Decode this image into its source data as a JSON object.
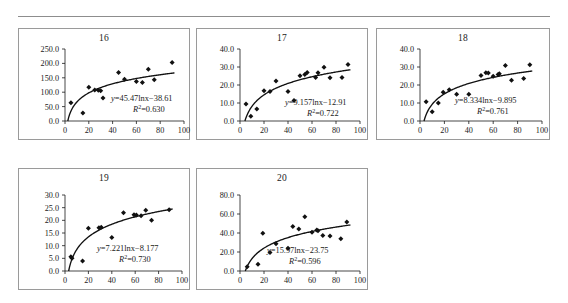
{
  "figure": {
    "has_top_rule": true,
    "panel_count": 5,
    "marker_shape": "diamond",
    "marker_color": "#111111",
    "curve_color": "#111111",
    "border_color": "#9a9a9a"
  },
  "chart_data": [
    {
      "type": "scatter",
      "title": "16",
      "xlabel": "",
      "ylabel": "",
      "xlim": [
        0,
        100
      ],
      "ylim": [
        0,
        250
      ],
      "xticks": [
        0,
        20,
        40,
        60,
        80,
        100
      ],
      "yticks": [
        "0.0",
        "50.0",
        "100.0",
        "150.0",
        "200.0",
        "250.0"
      ],
      "ytick_values": [
        0,
        50,
        100,
        150,
        200,
        250
      ],
      "grid": false,
      "legend": "none",
      "equation": "y=45.47lnx−38.61",
      "r2": "R²=0.630",
      "fit_a": 45.47,
      "fit_b": -38.61,
      "points": [
        [
          5,
          63
        ],
        [
          15,
          28
        ],
        [
          20,
          117
        ],
        [
          25,
          108
        ],
        [
          28,
          107
        ],
        [
          30,
          105
        ],
        [
          45,
          168
        ],
        [
          50,
          145
        ],
        [
          60,
          137
        ],
        [
          65,
          134
        ],
        [
          70,
          180
        ],
        [
          75,
          143
        ],
        [
          90,
          203
        ]
      ]
    },
    {
      "type": "scatter",
      "title": "17",
      "xlabel": "",
      "ylabel": "",
      "xlim": [
        0,
        100
      ],
      "ylim": [
        0,
        40
      ],
      "xticks": [
        0,
        20,
        40,
        60,
        80,
        100
      ],
      "yticks": [
        "0.0",
        "10.0",
        "20.0",
        "30.0",
        "40.0"
      ],
      "ytick_values": [
        0,
        10,
        20,
        30,
        40
      ],
      "grid": false,
      "legend": "none",
      "equation": "y=9.157lnx−12.91",
      "r2": "R²=0.722",
      "fit_a": 9.157,
      "fit_b": -12.91,
      "points": [
        [
          5,
          9.4
        ],
        [
          9,
          2.6
        ],
        [
          14,
          6.7
        ],
        [
          20,
          16.8
        ],
        [
          25,
          16.4
        ],
        [
          30,
          22.2
        ],
        [
          40,
          16.4
        ],
        [
          45,
          11.4
        ],
        [
          50,
          25.1
        ],
        [
          54,
          25.8
        ],
        [
          56,
          27.0
        ],
        [
          63,
          24.2
        ],
        [
          65,
          26.8
        ],
        [
          70,
          29.8
        ],
        [
          75,
          24.0
        ],
        [
          85,
          24.2
        ],
        [
          90,
          31.4
        ]
      ]
    },
    {
      "type": "scatter",
      "title": "18",
      "xlabel": "",
      "ylabel": "",
      "xlim": [
        0,
        100
      ],
      "ylim": [
        0,
        40
      ],
      "xticks": [
        0,
        20,
        40,
        60,
        80,
        100
      ],
      "yticks": [
        "0.0",
        "10.0",
        "20.0",
        "30.0",
        "40.0"
      ],
      "ytick_values": [
        0,
        10,
        20,
        30,
        40
      ],
      "grid": false,
      "legend": "none",
      "equation": "y=8.334lnx−9.895",
      "r2": "R²=0.761",
      "fit_a": 8.334,
      "fit_b": -9.895,
      "points": [
        [
          5,
          10.7
        ],
        [
          10,
          5.2
        ],
        [
          15,
          10.0
        ],
        [
          19,
          16.0
        ],
        [
          24,
          17.3
        ],
        [
          30,
          14.8
        ],
        [
          40,
          14.8
        ],
        [
          50,
          25.3
        ],
        [
          54,
          26.8
        ],
        [
          56,
          26.6
        ],
        [
          60,
          24.8
        ],
        [
          64,
          25.8
        ],
        [
          65,
          26.2
        ],
        [
          70,
          30.8
        ],
        [
          75,
          22.7
        ],
        [
          85,
          23.6
        ],
        [
          90,
          31.3
        ]
      ]
    },
    {
      "type": "scatter",
      "title": "19",
      "xlabel": "",
      "ylabel": "",
      "xlim": [
        0,
        100
      ],
      "ylim": [
        0,
        30
      ],
      "xticks": [
        0,
        20,
        40,
        60,
        80,
        100
      ],
      "yticks": [
        "0.0",
        "5.0",
        "10.0",
        "15.0",
        "20.0",
        "25.0",
        "30.0"
      ],
      "ytick_values": [
        0,
        5,
        10,
        15,
        20,
        25,
        30
      ],
      "grid": false,
      "legend": "none",
      "equation": "y=7.221lnx−8.177",
      "r2": "R²=0.730",
      "fit_a": 7.221,
      "fit_b": -8.177,
      "points": [
        [
          5,
          5.6
        ],
        [
          6,
          5.0
        ],
        [
          15,
          3.9
        ],
        [
          20,
          16.9
        ],
        [
          29,
          17.1
        ],
        [
          31,
          17.3
        ],
        [
          40,
          13.2
        ],
        [
          50,
          23.0
        ],
        [
          59,
          22.2
        ],
        [
          61,
          22.1
        ],
        [
          65,
          21.8
        ],
        [
          69,
          24.0
        ],
        [
          74,
          20.0
        ],
        [
          89,
          24.2
        ]
      ]
    },
    {
      "type": "scatter",
      "title": "20",
      "xlabel": "",
      "ylabel": "",
      "xlim": [
        0,
        100
      ],
      "ylim": [
        0,
        80
      ],
      "xticks": [
        0,
        20,
        40,
        60,
        80,
        100
      ],
      "yticks": [
        "0.0",
        "20.0",
        "40.0",
        "60.0",
        "80.0"
      ],
      "ytick_values": [
        0,
        20,
        40,
        60,
        80
      ],
      "grid": false,
      "legend": "none",
      "equation": "y=15.97lnx−23.75",
      "r2": "R²=0.596",
      "fit_a": 15.97,
      "fit_b": -23.75,
      "points": [
        [
          6,
          4.5
        ],
        [
          15,
          7.0
        ],
        [
          19,
          39.8
        ],
        [
          25,
          19.5
        ],
        [
          30,
          28.6
        ],
        [
          40,
          24.0
        ],
        [
          44,
          46.8
        ],
        [
          49,
          44.3
        ],
        [
          54,
          57.0
        ],
        [
          60,
          40.8
        ],
        [
          64,
          43.2
        ],
        [
          65,
          42.4
        ],
        [
          69,
          37.4
        ],
        [
          75,
          36.8
        ],
        [
          84,
          34.0
        ],
        [
          89,
          51.5
        ]
      ]
    }
  ]
}
